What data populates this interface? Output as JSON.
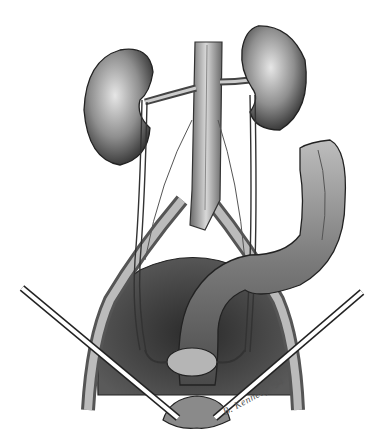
{
  "illustration": {
    "subject": "Anatomical pencil drawing of kidneys, ureters, great vessels, sigmoid colon and pelvic organs with retractors",
    "style": "graphite pencil, grayscale",
    "signature": "B. Kennedy '94",
    "colors": {
      "background": "#ffffff",
      "outline": "#222222",
      "shade_dark": "#3a3a3a",
      "shade_mid": "#8a8a8a",
      "shade_light": "#c8c8c8"
    },
    "structures": [
      "left-kidney",
      "right-kidney",
      "aorta-vena-cava",
      "renal-vessels",
      "ureters",
      "gonadal-vessels",
      "descending-sigmoid-colon",
      "iliac-vessels",
      "pelvic-cavity",
      "uterus",
      "bladder",
      "retractors"
    ]
  }
}
